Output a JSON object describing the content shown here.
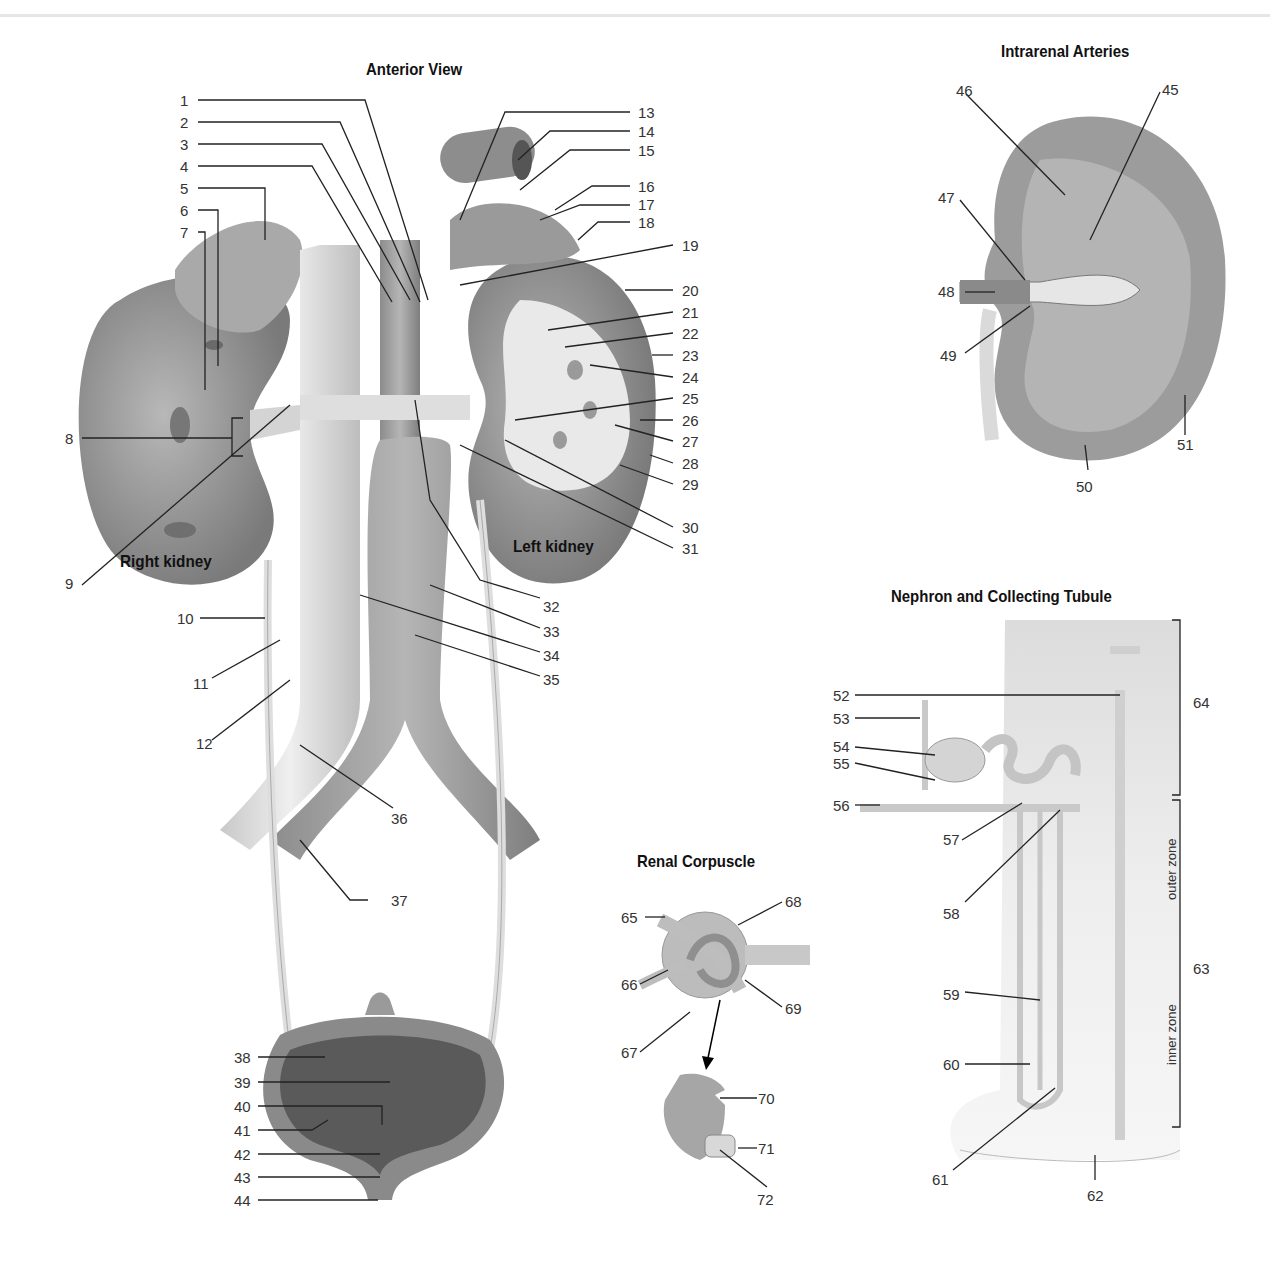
{
  "titles": {
    "anterior_view": "Anterior View",
    "intrarenal_arteries": "Intrarenal Arteries",
    "nephron": "Nephron and Collecting Tubule",
    "renal_corpuscle": "Renal Corpuscle"
  },
  "organ_labels": {
    "right_kidney": "Right kidney",
    "left_kidney": "Left kidney"
  },
  "zone_labels": {
    "outer": "outer zone",
    "inner": "inner zone"
  },
  "labels": {
    "n1": "1",
    "n2": "2",
    "n3": "3",
    "n4": "4",
    "n5": "5",
    "n6": "6",
    "n7": "7",
    "n8": "8",
    "n9": "9",
    "n10": "10",
    "n11": "11",
    "n12": "12",
    "n13": "13",
    "n14": "14",
    "n15": "15",
    "n16": "16",
    "n17": "17",
    "n18": "18",
    "n19": "19",
    "n20": "20",
    "n21": "21",
    "n22": "22",
    "n23": "23",
    "n24": "24",
    "n25": "25",
    "n26": "26",
    "n27": "27",
    "n28": "28",
    "n29": "29",
    "n30": "30",
    "n31": "31",
    "n32": "32",
    "n33": "33",
    "n34": "34",
    "n35": "35",
    "n36": "36",
    "n37": "37",
    "n38": "38",
    "n39": "39",
    "n40": "40",
    "n41": "41",
    "n42": "42",
    "n43": "43",
    "n44": "44",
    "n45": "45",
    "n46": "46",
    "n47": "47",
    "n48": "48",
    "n49": "49",
    "n50": "50",
    "n51": "51",
    "n52": "52",
    "n53": "53",
    "n54": "54",
    "n55": "55",
    "n56": "56",
    "n57": "57",
    "n58": "58",
    "n59": "59",
    "n60": "60",
    "n61": "61",
    "n62": "62",
    "n63": "63",
    "n64": "64",
    "n65": "65",
    "n66": "66",
    "n67": "67",
    "n68": "68",
    "n69": "69",
    "n70": "70",
    "n71": "71",
    "n72": "72"
  }
}
